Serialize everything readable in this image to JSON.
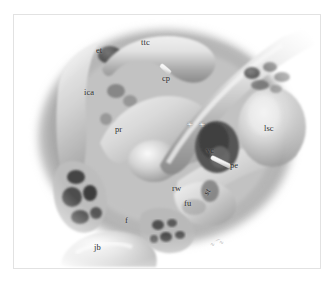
{
  "figure": {
    "style": "grayscale airbrush medical illustration",
    "frame_color": "#e2e2e2",
    "background_color": "#ffffff",
    "signature": "artist signature"
  },
  "labels": [
    {
      "id": "et",
      "text": "et",
      "meaning": "eustachian tube",
      "x": 96,
      "y": 46,
      "rotated": false
    },
    {
      "id": "ttc",
      "text": "ttc",
      "meaning": "tensor tympani canal",
      "x": 141,
      "y": 38,
      "rotated": false
    },
    {
      "id": "cp",
      "text": "cp",
      "meaning": "cochleariform process",
      "x": 162,
      "y": 74,
      "rotated": false
    },
    {
      "id": "ica",
      "text": "ica",
      "meaning": "internal carotid artery",
      "x": 84,
      "y": 88,
      "rotated": false
    },
    {
      "id": "pr",
      "text": "pr",
      "meaning": "promontory",
      "x": 115,
      "y": 125,
      "rotated": false
    },
    {
      "id": "lsc",
      "text": "lsc",
      "meaning": "lateral semicircular canal",
      "x": 264,
      "y": 124,
      "rotated": false
    },
    {
      "id": "vc",
      "text": "vc",
      "meaning": "vertical crest",
      "x": 206,
      "y": 146,
      "rotated": false
    },
    {
      "id": "pe",
      "text": "pe",
      "meaning": "pyramidal eminence",
      "x": 230,
      "y": 161,
      "rotated": false
    },
    {
      "id": "st",
      "text": "st",
      "meaning": "stapes",
      "x": 209,
      "y": 180,
      "rotated": true
    },
    {
      "id": "rw",
      "text": "rw",
      "meaning": "round window",
      "x": 172,
      "y": 184,
      "rotated": false
    },
    {
      "id": "fu",
      "text": "fu",
      "meaning": "fustis",
      "x": 184,
      "y": 199,
      "rotated": false
    },
    {
      "id": "f",
      "text": "f",
      "meaning": "facial nerve",
      "x": 125,
      "y": 216,
      "rotated": false
    },
    {
      "id": "jb",
      "text": "jb",
      "meaning": "jugular bulb",
      "x": 94,
      "y": 243,
      "rotated": false
    }
  ],
  "markers": [
    {
      "id": "asterisk-pair",
      "text": "✳ ✳",
      "meaning": "oval window niche markers",
      "x": 187,
      "y": 121
    }
  ],
  "pointers": [
    {
      "id": "probe-cp",
      "meaning": "white instrument pointing at cochleariform process"
    },
    {
      "id": "probe-pe",
      "meaning": "white instrument pointing at pyramidal eminence"
    }
  ]
}
